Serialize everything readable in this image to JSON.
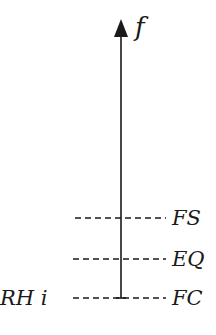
{
  "diagram": {
    "axis": {
      "label": "f",
      "direction": "up",
      "color": "#1a1a1a"
    },
    "levels": [
      {
        "name": "FS",
        "right_label": "FS",
        "left_label": ""
      },
      {
        "name": "EQ",
        "right_label": "EQ",
        "left_label": ""
      },
      {
        "name": "FC",
        "right_label": "FC",
        "left_label": "RH i"
      }
    ]
  }
}
